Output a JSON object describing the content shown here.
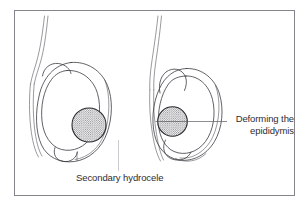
{
  "figure": {
    "frame": {
      "border_color": "#84848c",
      "background_color": "#ffffff"
    },
    "labels": {
      "left": {
        "text": "Secondary hydrocele",
        "points_to": "left-testis-hydrocele-sac",
        "leader": "vertical"
      },
      "right": {
        "line1": "Deforming the",
        "line2": "epididymis",
        "text": "Deforming the epididymis",
        "points_to": "right-testis-lesion",
        "leader": "horizontal"
      }
    },
    "panels": [
      {
        "name": "left-panel",
        "description": "Testis with tumour surrounded by a large secondary hydrocele sac",
        "parts": [
          "spermatic-cord",
          "hydrocele-sac",
          "testis-body",
          "epididymis",
          "tumour-lesion"
        ]
      },
      {
        "name": "right-panel",
        "description": "Testis with tumour at the epididymal pole deforming the epididymis",
        "parts": [
          "spermatic-cord",
          "tunica-sac",
          "testis-body",
          "epididymis",
          "tumour-lesion"
        ]
      }
    ],
    "colors": {
      "outline": "#3a3a40",
      "outline_thin": "#55555c",
      "lesion_outline": "#2a2a2e",
      "lesion_fill_dot": "#6b6b72",
      "leader": "#5a5a62",
      "leader_faint": "#b4b4ba",
      "text": "#2d2d33"
    }
  }
}
